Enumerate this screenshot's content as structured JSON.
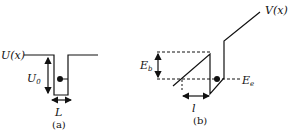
{
  "panel_a": {
    "potential_label": "U(x)",
    "depth_label": "U",
    "depth_sub": "0",
    "width_label": "L",
    "caption": "(a)"
  },
  "panel_b": {
    "potential_label": "V(x)",
    "barrier_label": "E",
    "barrier_sub": "b",
    "energy_label": "E",
    "energy_sub": "e",
    "width_label": "l",
    "caption": "(b)"
  },
  "colors": {
    "line": "#111111",
    "background": "#ffffff"
  }
}
